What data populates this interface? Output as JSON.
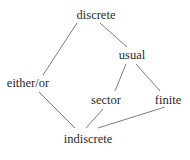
{
  "diagram": {
    "type": "hasse-diagram",
    "nodes": [
      {
        "id": "discrete",
        "label": "discrete",
        "x": 96,
        "y": 19
      },
      {
        "id": "usual",
        "label": "usual",
        "x": 132,
        "y": 59
      },
      {
        "id": "either_or",
        "label": "either/or",
        "x": 28,
        "y": 87
      },
      {
        "id": "sector",
        "label": "sector",
        "x": 106,
        "y": 104
      },
      {
        "id": "finite",
        "label": "finite",
        "x": 168,
        "y": 104
      },
      {
        "id": "indiscrete",
        "label": "indiscrete",
        "x": 88,
        "y": 143
      }
    ],
    "edges": [
      {
        "from": "discrete",
        "to": "either_or",
        "x1": 77,
        "y1": 23,
        "x2": 43,
        "y2": 75
      },
      {
        "from": "discrete",
        "to": "usual",
        "x1": 100,
        "y1": 23,
        "x2": 127,
        "y2": 47
      },
      {
        "from": "usual",
        "to": "sector",
        "x1": 126,
        "y1": 64,
        "x2": 115,
        "y2": 91
      },
      {
        "from": "usual",
        "to": "finite",
        "x1": 136,
        "y1": 64,
        "x2": 160,
        "y2": 91
      },
      {
        "from": "either_or",
        "to": "indiscrete",
        "x1": 39,
        "y1": 92,
        "x2": 75,
        "y2": 128
      },
      {
        "from": "sector",
        "to": "indiscrete",
        "x1": 103,
        "y1": 109,
        "x2": 86,
        "y2": 128
      },
      {
        "from": "finite",
        "to": "indiscrete",
        "x1": 165,
        "y1": 107,
        "x2": 98,
        "y2": 128
      }
    ],
    "colors": {
      "edge": "#6e6e6e",
      "text": "#2a2a2a",
      "background": "#ffffff"
    }
  }
}
